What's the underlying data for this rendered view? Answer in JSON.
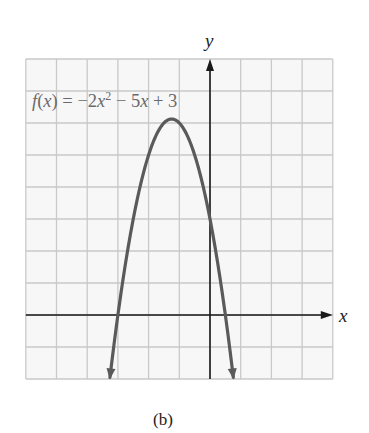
{
  "chart_data": {
    "type": "line",
    "function": {
      "a": -2,
      "b": -5,
      "c": 3
    },
    "equation_label": {
      "f": "f",
      "open": "(",
      "var": "x",
      "close_eq": ") = −2",
      "var2": "x",
      "exp": "2",
      "rest1": " − 5",
      "var3": "x",
      "rest2": " + 3"
    },
    "xlabel": "x",
    "ylabel": "y",
    "xlim": [
      -6,
      4
    ],
    "ylim": [
      -2,
      8
    ],
    "grid": true,
    "grid_step": 1,
    "vertex": {
      "x": -1.25,
      "y": 6.125
    },
    "x_intercepts": [
      -3,
      0.5
    ],
    "y_intercept": 3,
    "curve_endpoints_arrows": true,
    "caption": "(b)",
    "colors": {
      "curve": "#5a5a5a",
      "grid": "#c9c9c9",
      "axes": "#1a1a1a",
      "label": "#6a6a6a",
      "background": "#ffffff",
      "grid_background": "#f7f7f7"
    }
  }
}
